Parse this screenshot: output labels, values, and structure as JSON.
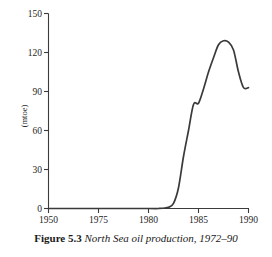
{
  "caption": {
    "label": "Figure 5.3",
    "text": "North Sea oil production, 1972–90"
  },
  "chart_data": {
    "type": "line",
    "title": "North Sea oil production, 1972–90",
    "xlabel": "",
    "ylabel": "(mtoe)",
    "xlim": [
      1950,
      1990
    ],
    "ylim": [
      0,
      150
    ],
    "grid": false,
    "legend": null,
    "x_ticks": [
      1950,
      1975,
      1980,
      1985,
      1990
    ],
    "x_tick_labels": [
      "1950",
      "1975",
      "1980",
      "1985",
      "1990"
    ],
    "y_ticks": [
      0,
      30,
      60,
      90,
      120,
      150
    ],
    "y_tick_labels": [
      "0",
      "30",
      "60",
      "90",
      "120",
      "150"
    ],
    "line_color": "#3a3a3a",
    "x": [
      1950,
      1960,
      1970,
      1972,
      1974,
      1975,
      1976,
      1977,
      1978,
      1979,
      1980,
      1981,
      1982,
      1983,
      1984,
      1985,
      1986,
      1987,
      1988,
      1989,
      1990
    ],
    "values": [
      0,
      0,
      0,
      0,
      1,
      4,
      16,
      40,
      60,
      80,
      81,
      92,
      105,
      116,
      126,
      129,
      128,
      122,
      105,
      93,
      93
    ],
    "series": [
      {
        "name": "North Sea oil production (mtoe)",
        "values": [
          0,
          0,
          0,
          0,
          1,
          4,
          16,
          40,
          60,
          80,
          81,
          92,
          105,
          116,
          126,
          129,
          128,
          122,
          105,
          93,
          93
        ]
      }
    ],
    "annotations": []
  }
}
